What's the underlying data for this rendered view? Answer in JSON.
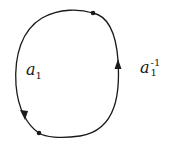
{
  "diagram": {
    "loop": {
      "stroke": "#1a1a1a",
      "points": [
        {
          "name": "top-point",
          "x": 93,
          "y": 13
        },
        {
          "name": "bottom-point",
          "x": 39,
          "y": 133
        }
      ],
      "arrows": [
        {
          "name": "right-arrow",
          "x": 118,
          "y": 66,
          "direction": "up"
        },
        {
          "name": "left-arrow",
          "x": 24,
          "y": 115,
          "direction": "down"
        }
      ]
    },
    "labels": {
      "left": {
        "base": "a",
        "sub": "1",
        "sup": ""
      },
      "right": {
        "base": "a",
        "sub": "1",
        "sup": "-1"
      }
    }
  }
}
